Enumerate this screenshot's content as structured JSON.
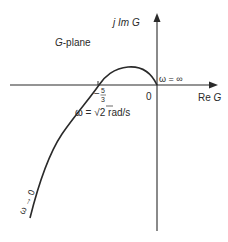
{
  "diagram": {
    "type": "nyquist-polar-plot",
    "plane_label": "G-plane",
    "axes": {
      "imag_label_prefix": "j Im ",
      "imag_label_var": "G",
      "real_label_prefix": "Re ",
      "real_label_var": "G",
      "origin_label": "0"
    },
    "annotations": {
      "crossing_value_sign": "−",
      "crossing_num": "5",
      "crossing_den": "3",
      "crossing_freq_prefix": "ω = ",
      "crossing_freq_sqrt": "√",
      "crossing_freq_val": "2",
      "crossing_freq_unit": " rad/s",
      "omega_inf": "ω = ∞",
      "omega_zero": "ω → 0"
    },
    "colors": {
      "stroke": "#2a2a2a",
      "background": "#ffffff"
    }
  }
}
